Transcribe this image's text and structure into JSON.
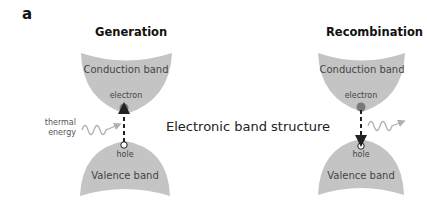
{
  "panel_label": "a",
  "center_label": "Electronic band structure",
  "colors": {
    "band_fill": "#c4c4c4",
    "arrow": "#222222",
    "wave": "#b0b0b0",
    "electron": "#7a7a7a"
  },
  "diagrams": [
    {
      "title": "Generation",
      "conduction_label": "Conduction band",
      "valence_label": "Valence band",
      "electron_label": "electron",
      "hole_label": "hole",
      "energy_label_line1": "thermal",
      "energy_label_line2": "energy",
      "arrow_direction": "up"
    },
    {
      "title": "Recombination",
      "conduction_label": "Conduction band",
      "valence_label": "Valence band",
      "electron_label": "electron",
      "hole_label": "hole",
      "arrow_direction": "down"
    }
  ]
}
